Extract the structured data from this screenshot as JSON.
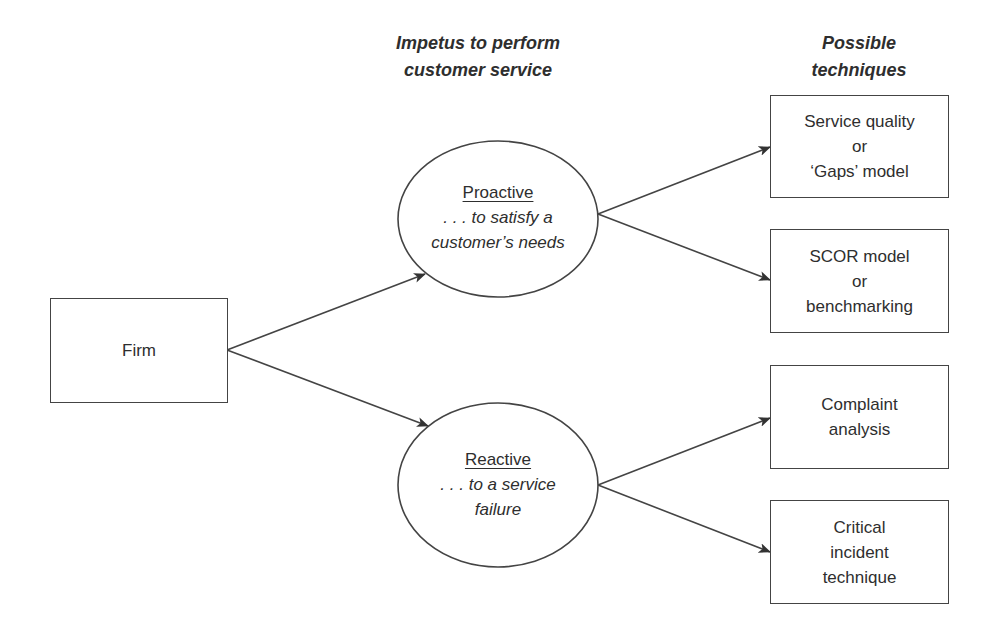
{
  "headings": {
    "impetus": [
      "Impetus to perform",
      "customer service"
    ],
    "techniques": [
      "Possible",
      "techniques"
    ]
  },
  "firm": {
    "label": "Firm"
  },
  "impetus_nodes": [
    {
      "title": "Proactive",
      "desc": [
        ". . . to satisfy a",
        "customer’s needs"
      ]
    },
    {
      "title": "Reactive",
      "desc": [
        ". . . to a service",
        "failure"
      ]
    }
  ],
  "techniques": [
    {
      "lines": [
        "Service quality",
        "or",
        "‘Gaps’ model"
      ]
    },
    {
      "lines": [
        "SCOR model",
        "or",
        "benchmarking"
      ]
    },
    {
      "lines": [
        "Complaint",
        "analysis"
      ]
    },
    {
      "lines": [
        "Critical",
        "incident",
        "technique"
      ]
    }
  ],
  "colors": {
    "stroke": "#444444",
    "text": "#2e2e2e",
    "background": "#ffffff"
  }
}
